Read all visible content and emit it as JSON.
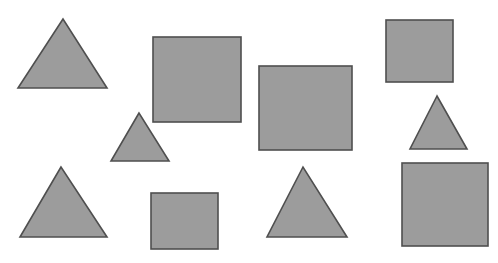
{
  "canvas": {
    "width": 498,
    "height": 263,
    "background_color": "#ffffff",
    "description": "White background with ten flat gray geometric shapes scattered across it"
  },
  "style": {
    "fill_color": "#9c9c9c",
    "stroke_color": "#4f4f4f",
    "stroke_width": 1.6
  },
  "counts": {
    "total_shapes": 10,
    "triangles": 5,
    "squares": 5
  },
  "shapes": [
    {
      "id": "triangle-1",
      "kind": "triangle",
      "label": "Large triangle, top left",
      "points": "63,19 18,88 107,88",
      "bbox": {
        "x": 18,
        "y": 19,
        "width": 89,
        "height": 69
      }
    },
    {
      "id": "square-1",
      "kind": "square",
      "label": "Large square, top center-left",
      "bbox": {
        "x": 153,
        "y": 37,
        "width": 88,
        "height": 85
      }
    },
    {
      "id": "square-2",
      "kind": "square",
      "label": "Large square, center",
      "bbox": {
        "x": 259,
        "y": 66,
        "width": 93,
        "height": 84
      }
    },
    {
      "id": "square-3",
      "kind": "square",
      "label": "Medium square, top right",
      "bbox": {
        "x": 386,
        "y": 20,
        "width": 67,
        "height": 62
      }
    },
    {
      "id": "triangle-2",
      "kind": "triangle",
      "label": "Small triangle, center left",
      "points": "139,113 111,161 169,161",
      "bbox": {
        "x": 111,
        "y": 113,
        "width": 58,
        "height": 48
      }
    },
    {
      "id": "triangle-3",
      "kind": "triangle",
      "label": "Small triangle, right",
      "points": "437,96 410,149 467,149",
      "bbox": {
        "x": 410,
        "y": 96,
        "width": 57,
        "height": 53
      }
    },
    {
      "id": "triangle-4",
      "kind": "triangle",
      "label": "Large triangle, bottom left",
      "points": "61,167 20,237 107,237",
      "bbox": {
        "x": 20,
        "y": 167,
        "width": 87,
        "height": 70
      }
    },
    {
      "id": "square-4",
      "kind": "square",
      "label": "Small square, bottom center-left",
      "bbox": {
        "x": 151,
        "y": 193,
        "width": 67,
        "height": 56
      }
    },
    {
      "id": "triangle-5",
      "kind": "triangle",
      "label": "Large triangle, bottom center",
      "points": "303,167 267,237 347,237",
      "bbox": {
        "x": 267,
        "y": 167,
        "width": 80,
        "height": 70
      }
    },
    {
      "id": "square-5",
      "kind": "square",
      "label": "Large square, bottom right",
      "bbox": {
        "x": 402,
        "y": 163,
        "width": 86,
        "height": 83
      }
    }
  ]
}
